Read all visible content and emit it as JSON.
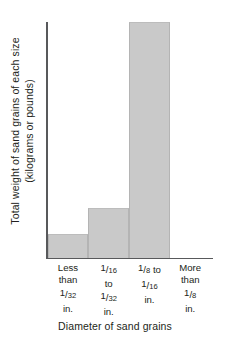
{
  "chart_data": {
    "type": "bar",
    "title": "",
    "categories": [
      "Less than 1/32 in.",
      "1/16 to 1/32 in.",
      "1/8 to 1/16 in.",
      "More than 1/8 in."
    ],
    "values": [
      10,
      21,
      100,
      0
    ],
    "ylabel": "Total weight of sand grains of each size (kilograms or pounds)",
    "xlabel": "Diameter of sand grains",
    "ylim": [
      0,
      100
    ],
    "grid": false,
    "legend": false,
    "tick_labels_y": [],
    "bar_color": "#c9c9c9",
    "axis_color": "#58595b"
  },
  "axes": {
    "y_title_line1": "Total weight of sand grains of each size",
    "y_title_line2": "(kilograms or pounds)",
    "x_title": "Diameter of sand grains"
  },
  "categories": [
    {
      "id": "less-than-1-32",
      "lines": [
        {
          "type": "text",
          "text": "Less"
        },
        {
          "type": "text",
          "text": "than"
        },
        {
          "type": "fraction",
          "num": "1",
          "den": "32"
        },
        {
          "type": "text",
          "text": "in."
        }
      ]
    },
    {
      "id": "1-16-to-1-32",
      "lines": [
        {
          "type": "fraction",
          "num": "1",
          "den": "16"
        },
        {
          "type": "text",
          "text": "to"
        },
        {
          "type": "fraction",
          "num": "1",
          "den": "32"
        },
        {
          "type": "text",
          "text": "in."
        }
      ]
    },
    {
      "id": "1-8-to-1-16",
      "lines": [
        {
          "type": "fraction",
          "num": "1",
          "den": "8",
          "suffix": " to"
        },
        {
          "type": "fraction",
          "num": "1",
          "den": "16"
        },
        {
          "type": "text",
          "text": "in."
        }
      ]
    },
    {
      "id": "more-than-1-8",
      "lines": [
        {
          "type": "text",
          "text": "More"
        },
        {
          "type": "text",
          "text": "than"
        },
        {
          "type": "fraction",
          "num": "1",
          "den": "8"
        },
        {
          "type": "text",
          "text": "in."
        }
      ]
    }
  ]
}
